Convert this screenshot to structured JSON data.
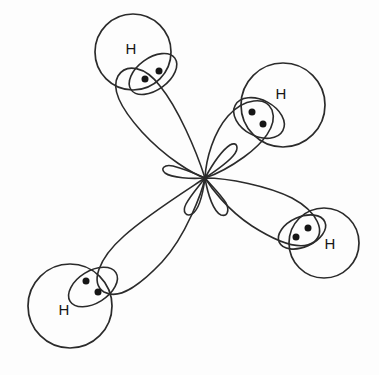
{
  "figure": {
    "background_color": "#fdfdfd",
    "line_color": "#2b2b2b",
    "dot_color": "#161616",
    "center": {
      "x": 205,
      "y": 178
    },
    "atom_label": "H",
    "atom_label_count": 4,
    "electron_pair_dots_per_bond": 2
  },
  "hydrogens": [
    {
      "id": "h-top-left",
      "label": "H",
      "circle": {
        "cx": 133,
        "cy": 52,
        "r": 38
      },
      "label_pos": {
        "x": 131,
        "y": 50
      },
      "lens": {
        "cx": 153,
        "cy": 74,
        "rx": 27,
        "ry": 16,
        "rotate": -36
      },
      "dots": [
        {
          "x": 145,
          "y": 79
        },
        {
          "x": 159,
          "y": 71
        }
      ]
    },
    {
      "id": "h-top-right",
      "label": "H",
      "circle": {
        "cx": 283,
        "cy": 105,
        "r": 42
      },
      "label_pos": {
        "x": 281,
        "y": 95
      },
      "lens": {
        "cx": 259,
        "cy": 118,
        "rx": 27,
        "ry": 18,
        "rotate": 28
      },
      "dots": [
        {
          "x": 252,
          "y": 112
        },
        {
          "x": 263,
          "y": 124
        }
      ]
    },
    {
      "id": "h-right-lower",
      "label": "H",
      "circle": {
        "cx": 324,
        "cy": 243,
        "r": 35
      },
      "label_pos": {
        "x": 330,
        "y": 245
      },
      "lens": {
        "cx": 302,
        "cy": 232,
        "rx": 25,
        "ry": 15,
        "rotate": -24
      },
      "dots": [
        {
          "x": 296,
          "y": 237
        },
        {
          "x": 308,
          "y": 228
        }
      ]
    },
    {
      "id": "h-bottom-left",
      "label": "H",
      "circle": {
        "cx": 70,
        "cy": 306,
        "r": 42
      },
      "label_pos": {
        "x": 64,
        "y": 311
      },
      "lens": {
        "cx": 93,
        "cy": 287,
        "rx": 27,
        "ry": 16,
        "rotate": -32
      },
      "dots": [
        {
          "x": 86,
          "y": 281
        },
        {
          "x": 98,
          "y": 292
        }
      ]
    }
  ],
  "lobes": [
    {
      "id": "lobe-top-left",
      "points_to": "h-top-left",
      "path": "M 205 178 C 196 150 178 108 160 86 C 145 66 126 63 118 76 C 110 90 124 112 142 132 C 166 158 193 174 205 178 Z"
    },
    {
      "id": "lobe-top-right",
      "points_to": "h-top-right",
      "path": "M 205 178 C 206 158 214 132 228 116 C 244 98 266 96 272 110 C 278 126 262 144 244 157 C 226 170 211 176 205 178 Z"
    },
    {
      "id": "lobe-right-lower",
      "points_to": "h-right-lower",
      "path": "M 205 178 C 228 178 268 186 292 198 C 318 212 326 232 314 242 C 300 252 274 240 252 226 C 226 209 210 186 205 178 Z"
    },
    {
      "id": "lobe-bottom-left",
      "points_to": "h-bottom-left",
      "path": "M 205 178 C 184 192 146 216 124 236 C 98 259 90 283 104 292 C 120 301 142 283 162 262 C 186 236 202 192 205 178 Z"
    }
  ],
  "back_lobes": [
    {
      "id": "backlobe-1",
      "opposite_of": "lobe-top-left",
      "path": "M 205 178 C 212 186 222 196 226 203 C 230 211 227 217 221 215 C 214 212 208 196 205 178 Z"
    },
    {
      "id": "backlobe-2",
      "opposite_of": "lobe-top-right",
      "path": "M 205 178 C 199 186 190 196 186 204 C 182 212 186 217 192 214 C 199 210 203 193 205 178 Z"
    },
    {
      "id": "backlobe-3",
      "opposite_of": "lobe-right-lower",
      "path": "M 205 178 C 194 173 181 168 173 166 C 164 164 160 169 165 173 C 172 178 191 179 205 178 Z"
    },
    {
      "id": "backlobe-4",
      "opposite_of": "lobe-bottom-left",
      "path": "M 205 178 C 214 172 227 163 233 156 C 240 148 237 141 230 145 C 221 151 211 167 205 178 Z"
    }
  ],
  "chart_data": {
    "type": "diagram",
    "xlabel": "",
    "ylabel": "",
    "legend": [],
    "annotations": [
      "H",
      "H",
      "H",
      "H"
    ],
    "bond_count": 4,
    "electrons_total": 8
  }
}
